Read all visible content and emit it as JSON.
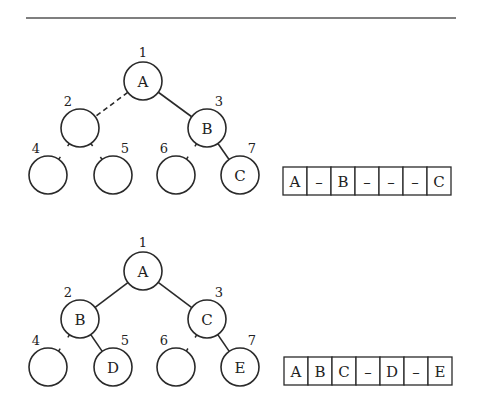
{
  "figure": {
    "rule": {
      "x1": 26,
      "x2": 456,
      "y": 18
    }
  },
  "diagrams": [
    {
      "name": "tree-1",
      "nodes": [
        {
          "index": "1",
          "label": "A",
          "x": 143,
          "y": 81
        },
        {
          "index": "2",
          "label": "",
          "x": 80,
          "y": 128
        },
        {
          "index": "3",
          "label": "B",
          "x": 207,
          "y": 128
        },
        {
          "index": "4",
          "label": "",
          "x": 48,
          "y": 175
        },
        {
          "index": "5",
          "label": "",
          "x": 113,
          "y": 175
        },
        {
          "index": "6",
          "label": "",
          "x": 176,
          "y": 175
        },
        {
          "index": "7",
          "label": "C",
          "x": 240,
          "y": 175
        }
      ],
      "edges": [
        {
          "from": 0,
          "to": 1,
          "style": "dashed"
        },
        {
          "from": 0,
          "to": 2,
          "style": "solid"
        },
        {
          "from": 2,
          "to": 6,
          "style": "solid"
        }
      ],
      "stubs": [
        {
          "parent": 1,
          "child": 3
        },
        {
          "parent": 1,
          "child": 4
        },
        {
          "parent": 2,
          "child": 5
        }
      ],
      "array": {
        "x": 283,
        "y": 167,
        "cell_w": 24,
        "cell_h": 28,
        "cells": [
          "A",
          "–",
          "B",
          "–",
          "–",
          "–",
          "C"
        ]
      }
    },
    {
      "name": "tree-2",
      "nodes": [
        {
          "index": "1",
          "label": "A",
          "x": 143,
          "y": 271
        },
        {
          "index": "2",
          "label": "B",
          "x": 80,
          "y": 319
        },
        {
          "index": "3",
          "label": "C",
          "x": 207,
          "y": 319
        },
        {
          "index": "4",
          "label": "",
          "x": 48,
          "y": 367
        },
        {
          "index": "5",
          "label": "D",
          "x": 113,
          "y": 367
        },
        {
          "index": "6",
          "label": "",
          "x": 176,
          "y": 367
        },
        {
          "index": "7",
          "label": "E",
          "x": 240,
          "y": 367
        }
      ],
      "edges": [
        {
          "from": 0,
          "to": 1,
          "style": "solid"
        },
        {
          "from": 0,
          "to": 2,
          "style": "solid"
        },
        {
          "from": 1,
          "to": 4,
          "style": "solid"
        },
        {
          "from": 2,
          "to": 6,
          "style": "solid"
        }
      ],
      "stubs": [
        {
          "parent": 1,
          "child": 3
        },
        {
          "parent": 2,
          "child": 5
        }
      ],
      "array": {
        "x": 284,
        "y": 357,
        "cell_w": 24,
        "cell_h": 28,
        "cells": [
          "A",
          "B",
          "C",
          "–",
          "D",
          "–",
          "E"
        ]
      }
    }
  ],
  "style": {
    "node_radius": 19,
    "stroke": "#2a2a2a",
    "background": "#ffffff"
  }
}
